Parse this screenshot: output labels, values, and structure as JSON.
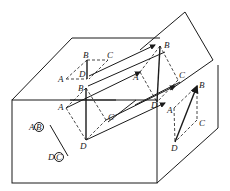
{
  "diagram": {
    "type": "geometry-projection",
    "labels": {
      "top_B": "B",
      "top_C": "C",
      "top_A": "A",
      "top_D": "D",
      "mid_B": "B",
      "mid_A": "A",
      "mid_C": "C",
      "mid_D": "D",
      "inc_B": "B",
      "inc_A": "A",
      "inc_C": "C",
      "inc_D": "D",
      "side_B": "B",
      "side_A": "A",
      "side_C": "C",
      "side_D": "D",
      "front_A": "A",
      "front_B": "B",
      "front_D": "D",
      "front_C": "C"
    },
    "colors": {
      "stroke": "#1a1a1a",
      "background": "#ffffff"
    }
  }
}
